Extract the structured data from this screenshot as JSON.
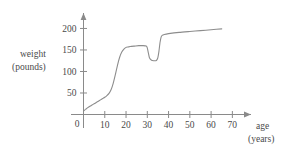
{
  "figure": {
    "background_color": "#ffffff",
    "line_color": "#8d8d8d",
    "axis_color": "#8a8a8a",
    "text_color": "#4a4a4a"
  },
  "labels": {
    "y_axis_line1": "weight",
    "y_axis_line2": "(pounds)",
    "x_axis_line1": "age",
    "x_axis_line2": "(years)",
    "origin": "0"
  },
  "chart_data": {
    "type": "line",
    "title": "",
    "subtitle": "",
    "xlabel": "age (years)",
    "ylabel": "weight (pounds)",
    "xlim": [
      0,
      75
    ],
    "ylim": [
      0,
      215
    ],
    "grid": false,
    "legend": null,
    "legend_position": "none",
    "x_ticks": [
      10,
      20,
      30,
      40,
      50,
      60,
      70
    ],
    "x_tick_labels": [
      "10",
      "20",
      "30",
      "40",
      "50",
      "60",
      "70"
    ],
    "y_ticks": [
      50,
      100,
      150,
      200
    ],
    "y_tick_labels": [
      "50",
      "100",
      "150",
      "200"
    ],
    "origin_label": "0",
    "annotations": [],
    "series": [
      {
        "name": "weight",
        "x": [
          0,
          1,
          2,
          3,
          4,
          5,
          6,
          7,
          8,
          9,
          10,
          11,
          12,
          13,
          14,
          15,
          16,
          17,
          18,
          19,
          20,
          21,
          22,
          24,
          26,
          28,
          29.5,
          30,
          30.5,
          31,
          32,
          33,
          34,
          34.5,
          35,
          35.5,
          36,
          36.5,
          37,
          38,
          40,
          45,
          50,
          55,
          60,
          65
        ],
        "y": [
          8,
          12,
          16,
          19,
          22,
          25,
          28,
          31,
          34,
          37,
          40,
          44,
          49,
          58,
          73,
          93,
          115,
          133,
          145,
          152,
          156,
          157,
          158,
          159,
          160,
          160,
          159,
          155,
          143,
          132,
          126,
          125,
          125,
          127,
          133,
          148,
          168,
          180,
          184,
          186,
          188,
          191,
          193,
          195,
          197,
          199
        ]
      }
    ]
  }
}
